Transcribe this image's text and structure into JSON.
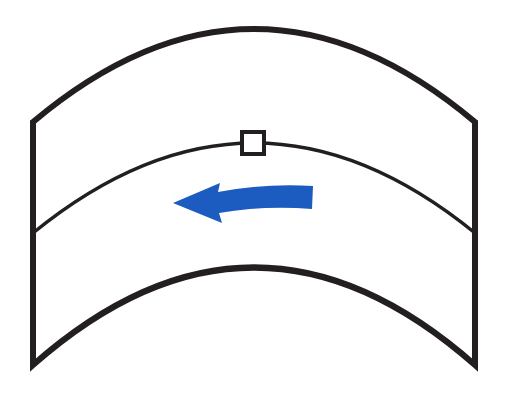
{
  "diagram": {
    "type": "curved-band-flow",
    "colors": {
      "outline": "#231f20",
      "arrow": "#1c5bbf",
      "background": "#ffffff",
      "marker_fill": "#ffffff"
    },
    "elements": {
      "outer_shape": {
        "label": ""
      },
      "divider_line": {
        "label": ""
      },
      "marker": {
        "label": ""
      },
      "flow_arrow": {
        "label": "",
        "direction": "left"
      }
    }
  }
}
